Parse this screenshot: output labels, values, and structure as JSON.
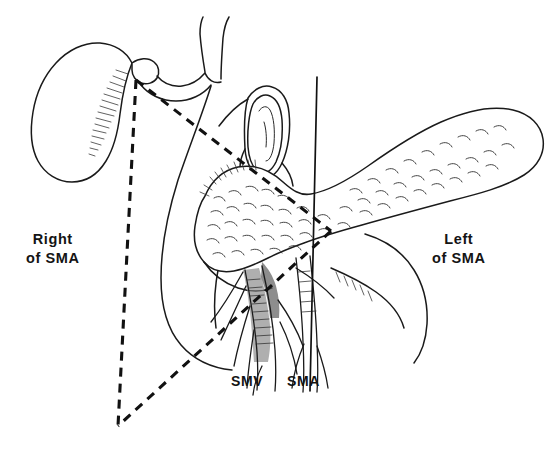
{
  "figure": {
    "background_color": "#ffffff",
    "ink_color": "#1a1a1a",
    "width": 555,
    "height": 449
  },
  "labels": {
    "right_of_sma": "Right\nof SMA",
    "left_of_sma": "Left\nof SMA",
    "smv": "SMV",
    "sma": "SMA"
  },
  "annotations": {
    "dashed_triangle": {
      "name": "resection-margin-triangle",
      "style": "dashed",
      "apex": [
        136,
        80
      ],
      "bottom_vertex": [
        118,
        426
      ],
      "right_vertex": [
        331,
        231
      ]
    },
    "sma_axis_line": {
      "name": "sma-vertical-axis",
      "style": "solid",
      "top": [
        317,
        77
      ],
      "bottom": [
        310,
        391
      ]
    }
  },
  "structures": [
    {
      "name": "gallbladder",
      "side": "right-of-sma"
    },
    {
      "name": "duodenum-descending",
      "side": "right-of-sma"
    },
    {
      "name": "common-bile-duct",
      "side": "right-of-sma"
    },
    {
      "name": "transected-jejunum",
      "side": "midline"
    },
    {
      "name": "pancreatic-head",
      "side": "right-of-sma"
    },
    {
      "name": "pancreatic-body-and-tail",
      "side": "left-of-sma"
    },
    {
      "name": "superior-mesenteric-vein",
      "side": "midline"
    },
    {
      "name": "superior-mesenteric-artery",
      "side": "midline"
    }
  ]
}
